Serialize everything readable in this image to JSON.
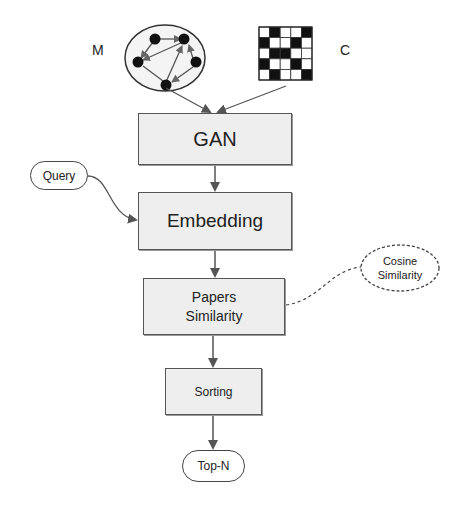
{
  "diagram": {
    "nodes": {
      "m_label": "M",
      "c_label": "C",
      "gan": "GAN",
      "query": "Query",
      "embedding": "Embedding",
      "papers_similarity_line1": "Papers",
      "papers_similarity_line2": "Similarity",
      "cosine_line1": "Cosine",
      "cosine_line2": "Similarity",
      "sorting": "Sorting",
      "top_n": "Top-N"
    },
    "edges": [
      {
        "from": "M-graph",
        "to": "GAN",
        "style": "solid-arrow"
      },
      {
        "from": "C-matrix",
        "to": "GAN",
        "style": "solid-arrow"
      },
      {
        "from": "GAN",
        "to": "Embedding",
        "style": "solid-arrow"
      },
      {
        "from": "Query",
        "to": "Embedding",
        "style": "curved-arrow"
      },
      {
        "from": "Embedding",
        "to": "Papers Similarity",
        "style": "solid-arrow"
      },
      {
        "from": "Cosine Similarity",
        "to": "Papers Similarity",
        "style": "dashed-line"
      },
      {
        "from": "Papers Similarity",
        "to": "Sorting",
        "style": "solid-arrow"
      },
      {
        "from": "Sorting",
        "to": "Top-N",
        "style": "solid-arrow"
      }
    ],
    "matrix_c": [
      [
        0,
        1,
        0,
        0,
        1
      ],
      [
        1,
        0,
        0,
        1,
        0
      ],
      [
        0,
        1,
        1,
        0,
        0
      ],
      [
        1,
        0,
        0,
        1,
        0
      ],
      [
        0,
        1,
        0,
        0,
        1
      ]
    ],
    "colors": {
      "box_fill": "#eeeeee",
      "box_border": "#555555",
      "arrow": "#555555",
      "text": "#222222"
    }
  }
}
